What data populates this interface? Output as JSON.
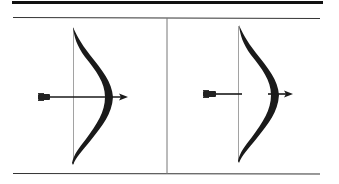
{
  "figure": {
    "colors": {
      "ink": "#1a1a1a",
      "rule": "#222222",
      "divider": "#777777",
      "string": "#888888",
      "background": "#ffffff"
    },
    "panels": [
      {
        "id": "left",
        "label": "",
        "arrow_state": "continuous shaft passing through bow"
      },
      {
        "id": "right",
        "label": "",
        "arrow_state": "shaft interrupted between string and bow"
      }
    ]
  }
}
